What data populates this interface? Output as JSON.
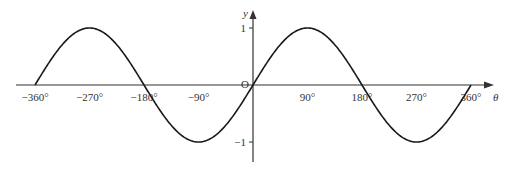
{
  "chart_data": {
    "type": "line",
    "title": "",
    "function": "y = sin θ",
    "xlabel": "θ",
    "ylabel": "y",
    "origin_label": "O",
    "x_ticks": [
      -360,
      -270,
      -180,
      -90,
      90,
      180,
      270,
      360
    ],
    "x_tick_labels": [
      "−360°",
      "−270°",
      "−180°",
      "−90°",
      "90°",
      "180°",
      "270°",
      "360°"
    ],
    "y_ticks": [
      1,
      -1
    ],
    "y_tick_labels": [
      "1",
      "−1"
    ],
    "xlim": [
      -360,
      360
    ],
    "ylim": [
      -1,
      1
    ],
    "grid": false,
    "legend": null,
    "series": [
      {
        "name": "sin θ",
        "x": [
          -360,
          -315,
          -270,
          -225,
          -180,
          -135,
          -90,
          -45,
          0,
          45,
          90,
          135,
          180,
          225,
          270,
          315,
          360
        ],
        "values": [
          0,
          0.707,
          1,
          0.707,
          0,
          -0.707,
          -1,
          -0.707,
          0,
          0.707,
          1,
          0.707,
          0,
          -0.707,
          -1,
          -0.707,
          0
        ]
      }
    ],
    "colors": {
      "curve": "#1a1a1a",
      "axes": "#333333"
    }
  }
}
